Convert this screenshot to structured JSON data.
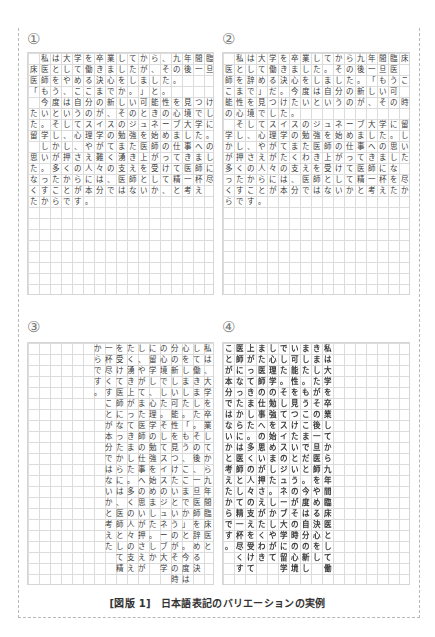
{
  "figure": {
    "caption_label": "[図版 1]",
    "caption_title": "日本語表記のバリエーションの実例"
  },
  "panels": [
    {
      "label": "①",
      "orientation": "horizontal",
      "lines": [
        "　私は大学を卒業してから、九年間臨",
        "床医として働きましたが、その後一旦",
        "医師をやめる決心をしました。",
        "「もう、ここまでか。」と。",
        "　今度は自分の新しい可能性を見つけ",
        "たいというのが、そのときの心境でし",
        "た。そしてスイスのジュネーブ大学に",
        "留学し、心理学の勉強を始めました。",
        "　しかし、やがてまた医師の仕事への",
        "思いが押さえ難く湧き上がってきまし",
        "た。多くの人々の支えを受けて医師に",
        "なったからには、医師として精一杯尽",
        "くすことが本分ではないか、と考え",
        "たからです。"
      ]
    },
    {
      "label": "②",
      "orientation": "horizontal",
      "lines": [
        "　私は大学を卒業してから九年間臨床",
        "医として働きました。その後一旦医",
        "師を辞める決心をしました。「もうこ",
        "こまで」だ。今度は自分の新しい可",
        "能性を見つけたいというのが、その時",
        "の心境でした。",
        "　そしてスイスのジュネーブ大学に留",
        "学し、心理学の勉強を始めました。し",
        "かし、やがてまた医師の仕事への思い",
        "が押さえがたくわき上がってきました。",
        "多くの人々の支えを受けて医師にな",
        "ったからには、医師として精一杯を尽",
        "くすことが本分ではないかと考えたか",
        "らです。"
      ]
    },
    {
      "label": "③",
      "orientation": "vertical",
      "columns": [
        "私は、大学を卒業してから九年間臨床医と",
        "して働きました。その後、一旦医師を辞める決",
        "心をしました。「もう、ここまでか」と。今度は自",
        "分の新しい可能性を見つけたいというのがその時",
        "の心境でした。そしてスイスのジュネーブ大学",
        "に留学し、心理学の勉強を始めました。しか",
        "し、やがてまた医師の仕事への思いが押さえが",
        "たく湧き上がってきました。多くの人々の支え",
        "を受けて医師になったからには、医師として精",
        "一杯尽くすことが本分ではないかと考えた",
        "からです。"
      ]
    },
    {
      "label": "④",
      "orientation": "vertical",
      "columns": [
        "私は大学を卒業してから九年間臨床医として働",
        "きましたがその後一旦医師をやめる決心をし",
        "ました。もうここまでだと。今度は自分の新し",
        "い可能性を見つけたいというのがその時の心境",
        "でした。そしてスイスのジュネーブ大学に留学",
        "し心理学の勉強を始めました。しかしやがて",
        "また医師の仕事への思いが押さえがたくわき",
        "上がってきました。多くの人々の支えを受けて",
        "医師になったからには医師として精一杯尽くす",
        "ことが本分ではないかと考えたからです。"
      ]
    }
  ]
}
